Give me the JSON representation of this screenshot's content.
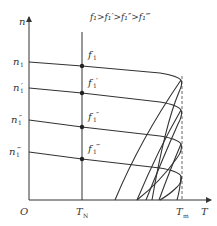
{
  "diagram": {
    "title_relation": "f₁>f₁′>f₁″>f₁‴",
    "axes": {
      "y_label": "n",
      "x_label": "T",
      "origin": "O",
      "x_ticks": [
        {
          "label": "T",
          "sub": "N"
        },
        {
          "label": "T",
          "sub": "m"
        }
      ]
    },
    "speed_levels": [
      {
        "label": "n",
        "sub": "1",
        "prime": ""
      },
      {
        "label": "n",
        "sub": "1",
        "prime": "′"
      },
      {
        "label": "n",
        "sub": "1",
        "prime": "″"
      },
      {
        "label": "n",
        "sub": "1",
        "prime": "‴"
      }
    ],
    "frequency_points": [
      {
        "label": "f",
        "sub": "1",
        "prime": ""
      },
      {
        "label": "f",
        "sub": "1",
        "prime": "′"
      },
      {
        "label": "f",
        "sub": "1",
        "prime": "″"
      },
      {
        "label": "f",
        "sub": "1",
        "prime": "‴"
      }
    ],
    "colors": {
      "line": "#333333",
      "dashed": "#555555",
      "background": "#ffffff"
    }
  },
  "caption": ""
}
